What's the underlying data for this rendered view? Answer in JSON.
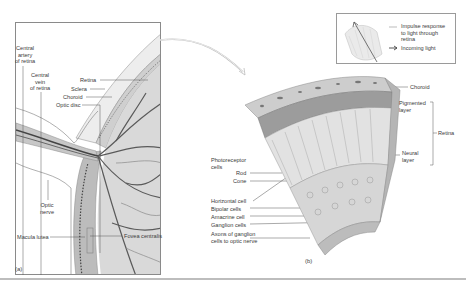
{
  "figure": {
    "panel_a": {
      "caption": "(a)",
      "labels": {
        "central_artery": "Central artery of retina",
        "central_artery_lines": [
          "Central",
          "artery",
          "of retina"
        ],
        "central_vein_lines": [
          "Central",
          "vein",
          "of retina"
        ],
        "retina": "Retina",
        "sclera": "Sclera",
        "choroid": "Choroid",
        "optic_disc": "Optic disc",
        "optic_nerve_lines": [
          "Optic",
          "nerve"
        ],
        "macula_lutea": "Macula lutea",
        "fovea_centralis": "Fovea centralis"
      }
    },
    "panel_b": {
      "caption": "(b)",
      "labels": {
        "choroid": "Choroid",
        "pigmented_layer_lines": [
          "Pigmented",
          "layer"
        ],
        "neural_layer_lines": [
          "Neural",
          "layer"
        ],
        "retina": "Retina",
        "photoreceptor_lines": [
          "Photoreceptor",
          "cells"
        ],
        "rod": "Rod",
        "cone": "Cone",
        "horizontal_cell": "Horizontal cell",
        "bipolar_cells": "Bipolar cells",
        "amacrine_cell": "Amacrine cell",
        "ganglion_cells": "Ganglion cells",
        "axons_lines": [
          "Axons of ganglion",
          "cells to optic nerve"
        ]
      }
    },
    "legend": {
      "items": [
        {
          "icon": "arrow-up-left-icon",
          "lines": [
            "Impulse response",
            "to light through",
            "retina"
          ]
        },
        {
          "icon": "arrow-right-icon",
          "lines": [
            "Incoming light"
          ]
        }
      ]
    },
    "colors": {
      "line": "#555555",
      "tissue_light": "#e6e6e6",
      "tissue_mid": "#bdbdbd",
      "vessel": "#5a5a5a",
      "border": "#8a8a8a"
    }
  }
}
